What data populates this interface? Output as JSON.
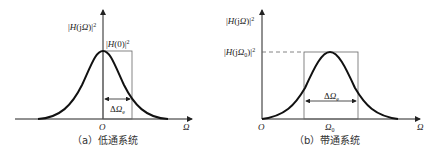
{
  "panels": [
    {
      "id": "a",
      "caption": "（a）低通系统",
      "y_axis_label": "|H(jΩ)|²",
      "peak_label": "|H(0)|²",
      "bandwidth_label": "ΔΩe",
      "origin_label": "O",
      "x_axis_label": "Ω"
    },
    {
      "id": "b",
      "caption": "（b）带通系统",
      "y_axis_label": "|H(jΩ)|²",
      "peak_label": "|H(jΩ0)|²",
      "bandwidth_label": "ΔΩe",
      "origin_label": "O",
      "center_label": "Ω0",
      "x_axis_label": "Ω"
    }
  ],
  "text": {
    "a_ylabel_pre": "|",
    "a_ylabel_H": "H",
    "a_ylabel_mid": "(j",
    "a_ylabel_Om": "Ω",
    "a_ylabel_post": ")|",
    "sq": "2",
    "a_peak_pre": "|",
    "a_peak_H": "H",
    "a_peak_post": "(0)|",
    "delta": "Δ",
    "Omega": "Ω",
    "e": "e",
    "O": "O",
    "b_peak_mid": "(j",
    "zero": "0",
    "b_peak_post": ")|",
    "caption_a": "（a）低通系统",
    "caption_b": "（b）带通系统"
  }
}
